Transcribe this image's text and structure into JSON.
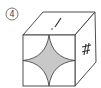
{
  "figure": {
    "label": "④",
    "top_face_mark": "/",
    "right_face_mark": "#",
    "front_face_pattern": "concave-star (astroid) shaded",
    "colors": {
      "line": "#3a3a3a",
      "shade": "#c8c8c8",
      "background": "#ffffff"
    }
  }
}
